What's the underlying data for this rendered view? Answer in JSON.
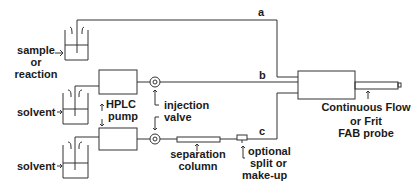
{
  "diagram": {
    "title": "",
    "lines": {
      "a": "a",
      "b": "b",
      "c": "c"
    },
    "labels": {
      "sample": [
        "sample",
        "or",
        "reaction"
      ],
      "solvent_top": "solvent",
      "solvent_bottom": "solvent",
      "hplc_pump": [
        "HPLC",
        "pump"
      ],
      "injection_valve": [
        "injection",
        "valve"
      ],
      "separation_column": [
        "separation",
        "column"
      ],
      "optional_split": [
        "optional",
        "split or",
        "make-up"
      ],
      "fab_probe": [
        "Continuous Flow",
        "or Frit",
        "FAB probe"
      ]
    },
    "colors": {
      "stroke": "#333333",
      "text": "#1a1a1a"
    }
  }
}
